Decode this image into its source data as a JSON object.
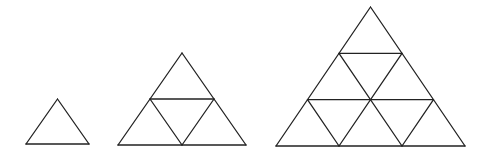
{
  "diagram": {
    "title": "",
    "stroke_color": "#222222",
    "background_color": "#ffffff",
    "figures": [
      {
        "name": "triangle-size-1",
        "subdivisions": 1,
        "small_triangles": 1
      },
      {
        "name": "triangle-size-2",
        "subdivisions": 2,
        "small_triangles": 4
      },
      {
        "name": "triangle-size-3",
        "subdivisions": 3,
        "small_triangles": 9
      }
    ]
  }
}
